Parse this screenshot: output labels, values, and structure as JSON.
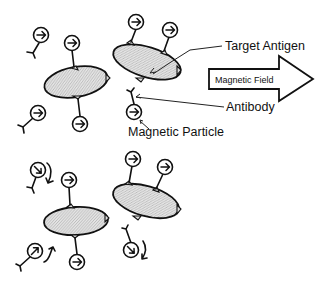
{
  "labels": {
    "target_antigen": "Target Antigen",
    "antibody": "Antibody",
    "magnetic_particle": "Magnetic Particle",
    "magnetic_field": "Magnetic Field"
  },
  "panels": [
    {
      "name": "aligned-state",
      "description": "Magnetic particles aligned with applied field (arrows pointing right)",
      "antigen_count": 2,
      "bound_particles": 4,
      "free_particles": 3,
      "particle_arrow_direction": "right"
    },
    {
      "name": "rotating-state",
      "description": "Free particles rotate (curved arrows); bound particles stay aligned",
      "antigen_count": 2,
      "bound_particles": 4,
      "free_particles": 3,
      "free_particle_motion": "rotating"
    }
  ],
  "colors": {
    "line": "#111111",
    "antigen_fill": "#d9d9d9",
    "background": "#ffffff"
  }
}
